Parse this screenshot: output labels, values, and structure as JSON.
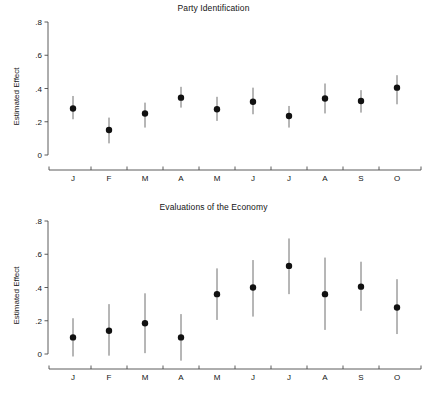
{
  "figure": {
    "width": 427,
    "height": 397,
    "background": "#ffffff",
    "marker_color": "#111111",
    "ci_color": "#6e6e6e",
    "axis_color": "#4a4a4a"
  },
  "chart_data": [
    {
      "type": "scatter",
      "panel_id": "panel-top",
      "title": "Party Identification",
      "xlabel": "",
      "ylabel": "Estimated Effect",
      "categories": [
        "J",
        "F",
        "M",
        "A",
        "M",
        "J",
        "J",
        "A",
        "S",
        "O"
      ],
      "values": [
        0.28,
        0.15,
        0.25,
        0.345,
        0.275,
        0.32,
        0.235,
        0.34,
        0.325,
        0.405
      ],
      "ci_lower": [
        0.215,
        0.07,
        0.165,
        0.285,
        0.205,
        0.245,
        0.165,
        0.25,
        0.255,
        0.305
      ],
      "ci_upper": [
        0.355,
        0.225,
        0.315,
        0.41,
        0.35,
        0.405,
        0.295,
        0.43,
        0.39,
        0.48
      ],
      "ylim": [
        0.0,
        0.8
      ],
      "yticks": [
        0.0,
        0.2,
        0.4,
        0.6,
        0.8
      ],
      "ytick_labels": [
        "0",
        ".2",
        ".4",
        ".6",
        ".8"
      ],
      "grid": false,
      "legend": "none",
      "error_bar_type": "confidence-interval"
    },
    {
      "type": "scatter",
      "panel_id": "panel-bottom",
      "title": "Evaluations of the Economy",
      "xlabel": "",
      "ylabel": "Estimated Effect",
      "categories": [
        "J",
        "F",
        "M",
        "A",
        "M",
        "J",
        "J",
        "A",
        "S",
        "O"
      ],
      "values": [
        0.1,
        0.14,
        0.185,
        0.1,
        0.36,
        0.4,
        0.53,
        0.36,
        0.405,
        0.28
      ],
      "ci_lower": [
        -0.015,
        -0.01,
        0.005,
        -0.04,
        0.205,
        0.225,
        0.36,
        0.145,
        0.26,
        0.12
      ],
      "ci_upper": [
        0.215,
        0.3,
        0.365,
        0.24,
        0.515,
        0.565,
        0.695,
        0.58,
        0.555,
        0.45
      ],
      "ylim": [
        0.0,
        0.8
      ],
      "yticks": [
        0.0,
        0.2,
        0.4,
        0.6,
        0.8
      ],
      "ytick_labels": [
        "0",
        ".2",
        ".4",
        ".6",
        ".8"
      ],
      "grid": false,
      "legend": "none",
      "error_bar_type": "confidence-interval"
    }
  ]
}
